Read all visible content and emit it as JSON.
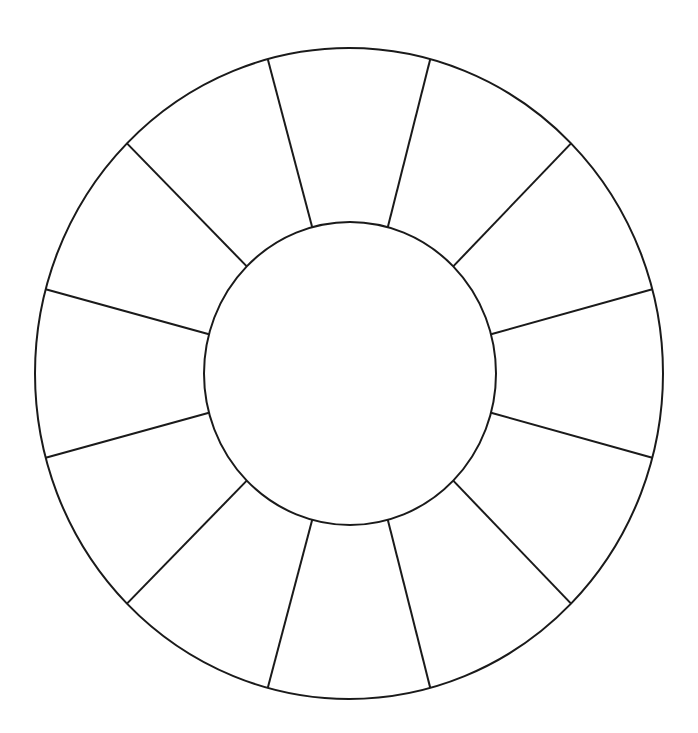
{
  "diagram": {
    "type": "blank-color-wheel-template",
    "segment_count": 12,
    "stroke_color": "#1a1a1a",
    "fill_color": "#ffffff",
    "background": "#ffffff",
    "outer": {
      "cx": 349,
      "cy": 373.5,
      "rx": 314,
      "ry": 325.5
    },
    "inner": {
      "cx": 350,
      "cy": 373.5,
      "rx": 146,
      "ry": 151.5
    },
    "spoke_angles_deg": [
      15,
      45,
      75,
      105,
      135,
      165,
      195,
      225,
      255,
      285,
      315,
      345
    ],
    "labels": []
  }
}
